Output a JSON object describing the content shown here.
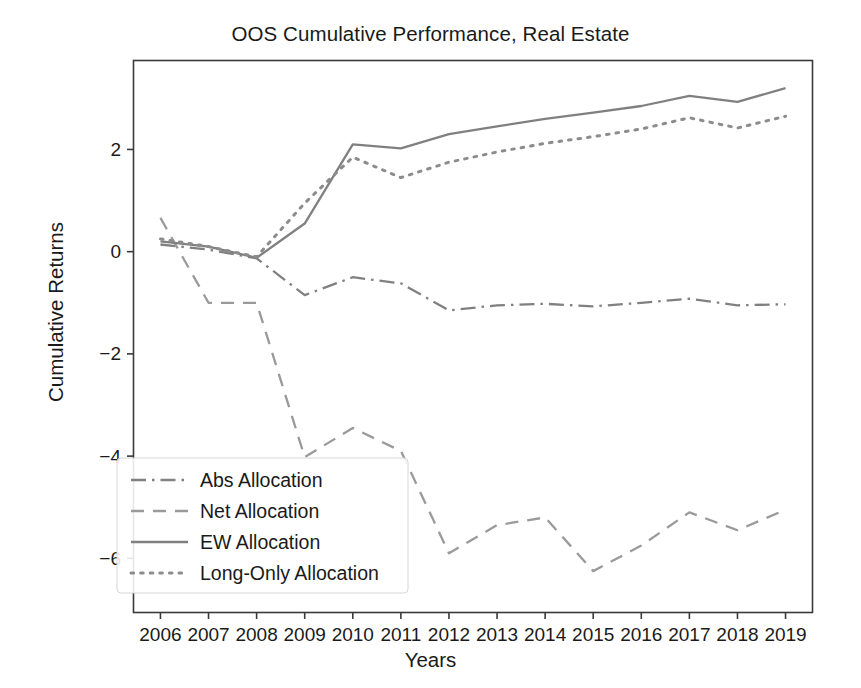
{
  "chart_data": {
    "type": "line",
    "title": "OOS Cumulative Performance, Real Estate",
    "xlabel": "Years",
    "ylabel": "Cumulative Returns",
    "x": [
      2006,
      2007,
      2008,
      2009,
      2010,
      2011,
      2012,
      2013,
      2014,
      2015,
      2016,
      2017,
      2018,
      2019
    ],
    "xtick_labels": [
      "2006",
      "2007",
      "2008",
      "2009",
      "2010",
      "2011",
      "2012",
      "2013",
      "2014",
      "2015",
      "2016",
      "2017",
      "2018",
      "2019"
    ],
    "ytick_labels": [
      "2",
      "0",
      "−2",
      "−4",
      "−6"
    ],
    "ytick_values": [
      2,
      0,
      -2,
      -4,
      -6
    ],
    "xlim": [
      2005.45,
      2019.55
    ],
    "ylim": [
      -7.05,
      3.75
    ],
    "grid": false,
    "legend_position": "lower left",
    "series": [
      {
        "name": "Abs Allocation",
        "style": "dashdot",
        "color": "#808080",
        "values": [
          0.14,
          0.04,
          -0.13,
          -0.85,
          -0.5,
          -0.62,
          -1.15,
          -1.05,
          -1.02,
          -1.07,
          -1.0,
          -0.92,
          -1.05,
          -1.03
        ]
      },
      {
        "name": "Net Allocation",
        "style": "dashed",
        "color": "#9a9a9a",
        "values": [
          0.66,
          -1.0,
          -1.0,
          -4.02,
          -3.45,
          -3.9,
          -5.9,
          -5.35,
          -5.2,
          -6.25,
          -5.75,
          -5.1,
          -5.45,
          -5.05
        ]
      },
      {
        "name": "EW Allocation",
        "style": "solid",
        "color": "#808080",
        "values": [
          0.2,
          0.1,
          -0.12,
          0.55,
          2.1,
          2.02,
          2.3,
          2.45,
          2.6,
          2.72,
          2.85,
          3.05,
          2.93,
          3.2
        ]
      },
      {
        "name": "Long-Only Allocation",
        "style": "dotted",
        "color": "#8c8c8c",
        "values": [
          0.25,
          0.1,
          -0.1,
          0.95,
          1.85,
          1.45,
          1.75,
          1.95,
          2.12,
          2.25,
          2.4,
          2.62,
          2.42,
          2.65
        ]
      }
    ]
  },
  "legend": {
    "items": [
      {
        "label": "Abs Allocation"
      },
      {
        "label": "Net Allocation"
      },
      {
        "label": "EW Allocation"
      },
      {
        "label": "Long-Only Allocation"
      }
    ]
  },
  "axes": {
    "spine_color": "#3a3a3a"
  }
}
